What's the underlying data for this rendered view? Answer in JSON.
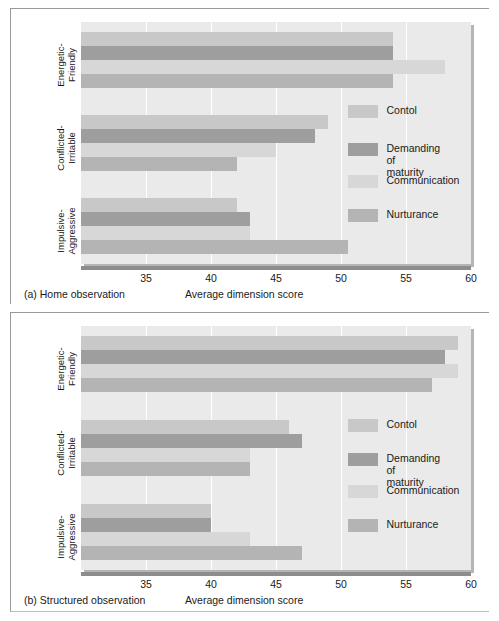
{
  "figure": {
    "y_axis_title": "Parents of children who were:",
    "x_axis_title": "Average dimension score"
  },
  "legend": {
    "items": [
      {
        "label": "Contol",
        "color": "#c8c8c8"
      },
      {
        "label": "Demanding of\nmaturity",
        "color": "#9e9e9e"
      },
      {
        "label": "Communication",
        "color": "#d7d7d7"
      },
      {
        "label": "Nurturance",
        "color": "#b4b4b4"
      }
    ]
  },
  "panels": [
    {
      "id": "a",
      "caption": "(a) Home observation",
      "x_title": "Average dimension score"
    },
    {
      "id": "b",
      "caption": "(b) Structured observation",
      "x_title": "Average dimension score"
    }
  ],
  "chart_data": [
    {
      "type": "bar",
      "orientation": "horizontal",
      "title": "(a) Home observation",
      "xlabel": "Average dimension score",
      "ylabel": "Parents of children who were:",
      "xlim": [
        30,
        60
      ],
      "xticks": [
        35,
        40,
        45,
        50,
        55,
        60
      ],
      "grid": true,
      "legend_position": "right-middle",
      "categories": [
        "Energetic-\nFriendly",
        "Conflicted-\nIrritable",
        "Impulsive-\nAggressive"
      ],
      "series": [
        {
          "name": "Contol",
          "color": "#c8c8c8",
          "values": [
            54,
            49,
            42
          ]
        },
        {
          "name": "Demanding of maturity",
          "color": "#9e9e9e",
          "values": [
            54,
            48,
            43
          ]
        },
        {
          "name": "Communication",
          "color": "#d7d7d7",
          "values": [
            58,
            45,
            43
          ]
        },
        {
          "name": "Nurturance",
          "color": "#b4b4b4",
          "values": [
            54,
            42,
            50.5
          ]
        }
      ]
    },
    {
      "type": "bar",
      "orientation": "horizontal",
      "title": "(b) Structured observation",
      "xlabel": "Average dimension score",
      "ylabel": "Parents of children who were:",
      "xlim": [
        30,
        60
      ],
      "xticks": [
        35,
        40,
        45,
        50,
        55,
        60
      ],
      "grid": true,
      "legend_position": "right-middle",
      "categories": [
        "Energetic-\nFriendly",
        "Conflicted-\nIrritable",
        "Impulsive-\nAggressive"
      ],
      "series": [
        {
          "name": "Contol",
          "color": "#c8c8c8",
          "values": [
            59,
            46,
            40
          ]
        },
        {
          "name": "Demanding of maturity",
          "color": "#9e9e9e",
          "values": [
            58,
            47,
            40
          ]
        },
        {
          "name": "Communication",
          "color": "#d7d7d7",
          "values": [
            59,
            43,
            43
          ]
        },
        {
          "name": "Nurturance",
          "color": "#b4b4b4",
          "values": [
            57,
            43,
            47
          ]
        }
      ]
    }
  ]
}
